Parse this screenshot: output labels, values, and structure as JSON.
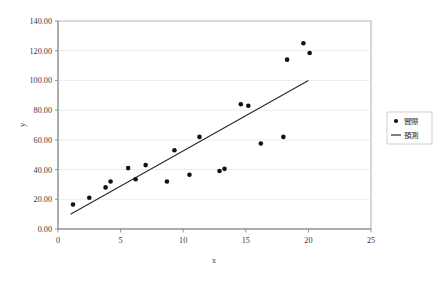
{
  "chart_data": {
    "type": "scatter",
    "title": "",
    "xlabel": "x",
    "ylabel": "y",
    "xlim": [
      0,
      25
    ],
    "ylim": [
      0,
      140
    ],
    "grid": "horizontal",
    "legend_position": "right",
    "x_ticks": [
      "0",
      "5",
      "10",
      "15",
      "20",
      "25"
    ],
    "x_tick_values": [
      0,
      5,
      10,
      15,
      20,
      25
    ],
    "y_ticks": [
      "0.00",
      "20.00",
      "40.00",
      "60.00",
      "80.00",
      "100.00",
      "120.00",
      "140.00"
    ],
    "y_tick_values": [
      0,
      20,
      40,
      60,
      80,
      100,
      120,
      140
    ],
    "series": [
      {
        "name": "實際",
        "type": "scatter",
        "marker": "circle",
        "color": "#111111",
        "points": [
          [
            1.2,
            16.5
          ],
          [
            2.5,
            21.0
          ],
          [
            3.8,
            28.0
          ],
          [
            4.2,
            32.0
          ],
          [
            5.6,
            41.0
          ],
          [
            6.2,
            33.5
          ],
          [
            7.0,
            43.0
          ],
          [
            8.7,
            32.0
          ],
          [
            9.3,
            53.0
          ],
          [
            10.5,
            36.5
          ],
          [
            11.3,
            62.0
          ],
          [
            12.9,
            39.0
          ],
          [
            13.3,
            40.5
          ],
          [
            14.6,
            84.0
          ],
          [
            15.2,
            83.0
          ],
          [
            16.2,
            57.5
          ],
          [
            18.0,
            62.0
          ],
          [
            18.3,
            114.0
          ],
          [
            19.6,
            125.0
          ],
          [
            20.1,
            118.5
          ]
        ]
      },
      {
        "name": "預測",
        "type": "line",
        "color": "#2a2a2a",
        "points": [
          [
            1.0,
            10.0
          ],
          [
            20.0,
            100.0
          ]
        ]
      }
    ]
  },
  "legend": {
    "entries": [
      {
        "label": "實際",
        "marker": "dot"
      },
      {
        "label": "預測",
        "marker": "line"
      }
    ]
  },
  "axes": {
    "x_title": "x",
    "y_title": "y"
  }
}
